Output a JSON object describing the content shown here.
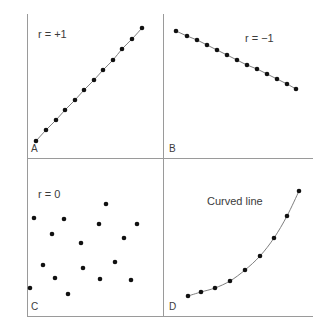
{
  "figure": {
    "background_color": "#ffffff",
    "axis_color": "#9a9a9a",
    "point_color": "#111111",
    "line_color": "#6f6f6f",
    "text_color": "#3b3b3b",
    "width": 319,
    "height": 330
  },
  "panels": {
    "a": {
      "letter": "A",
      "note": "r = +1",
      "note_x": 38,
      "note_y": 38,
      "letter_x": 31,
      "letter_y": 152
    },
    "b": {
      "letter": "B",
      "note": "r = −1",
      "note_x": 245,
      "note_y": 42,
      "letter_x": 169,
      "letter_y": 152
    },
    "c": {
      "letter": "C",
      "note": "r = 0",
      "note_x": 38,
      "note_y": 198,
      "letter_x": 31,
      "letter_y": 310
    },
    "d": {
      "letter": "D",
      "note": "Curved line",
      "note_x": 207,
      "note_y": 205,
      "letter_x": 169,
      "letter_y": 310
    }
  },
  "chart_data": [
    {
      "id": "panel-a",
      "type": "scatter",
      "title": "A",
      "annotation": "r = +1",
      "xlabel": "",
      "ylabel": "",
      "grid": false,
      "legend": false,
      "description": "Perfect positive linear relationship; all points lie exactly on an upward straight line.",
      "correlation": 1,
      "connected": true,
      "points": [
        [
          36,
          141
        ],
        [
          46,
          130
        ],
        [
          56,
          120
        ],
        [
          65,
          110
        ],
        [
          75,
          100
        ],
        [
          84,
          90
        ],
        [
          94,
          80
        ],
        [
          103,
          70
        ],
        [
          113,
          60
        ],
        [
          122,
          49
        ],
        [
          132,
          39
        ],
        [
          142,
          28
        ]
      ]
    },
    {
      "id": "panel-b",
      "type": "scatter",
      "title": "B",
      "annotation": "r = −1",
      "xlabel": "",
      "ylabel": "",
      "grid": false,
      "legend": false,
      "description": "Perfect negative linear relationship; all points lie exactly on a downward straight line.",
      "correlation": -1,
      "connected": true,
      "points": [
        [
          176,
          31
        ],
        [
          187,
          36
        ],
        [
          197,
          40
        ],
        [
          207,
          45
        ],
        [
          217,
          50
        ],
        [
          227,
          55
        ],
        [
          237,
          60
        ],
        [
          247,
          65
        ],
        [
          257,
          69
        ],
        [
          267,
          74
        ],
        [
          277,
          79
        ],
        [
          287,
          84
        ],
        [
          296,
          89
        ]
      ]
    },
    {
      "id": "panel-c",
      "type": "scatter",
      "title": "C",
      "annotation": "r = 0",
      "xlabel": "",
      "ylabel": "",
      "grid": false,
      "legend": false,
      "description": "No relationship; points are randomly scattered with no trend.",
      "correlation": 0,
      "connected": false,
      "points": [
        [
          106,
          204
        ],
        [
          34,
          218
        ],
        [
          64,
          219
        ],
        [
          137,
          224
        ],
        [
          99,
          224
        ],
        [
          52,
          234
        ],
        [
          124,
          238
        ],
        [
          81,
          243
        ],
        [
          43,
          265
        ],
        [
          115,
          262
        ],
        [
          83,
          268
        ],
        [
          55,
          278
        ],
        [
          100,
          279
        ],
        [
          131,
          280
        ],
        [
          30,
          288
        ],
        [
          68,
          294
        ]
      ]
    },
    {
      "id": "panel-d",
      "type": "scatter",
      "title": "D",
      "annotation": "Curved line",
      "xlabel": "",
      "ylabel": "",
      "grid": false,
      "legend": false,
      "description": "Curvilinear relationship; points follow a rising exponential-like curve.",
      "connected": true,
      "points": [
        [
          188,
          296
        ],
        [
          201,
          292
        ],
        [
          215,
          288
        ],
        [
          230,
          281
        ],
        [
          245,
          270
        ],
        [
          260,
          256
        ],
        [
          274,
          238
        ],
        [
          287,
          216
        ],
        [
          299,
          191
        ]
      ]
    }
  ],
  "axes": {
    "left_vertical": {
      "x": 27,
      "y1": 14,
      "y2": 316
    },
    "middle_vertical": {
      "x": 163,
      "y1": 14,
      "y2": 316
    },
    "middle_horizontal": {
      "x1": 27,
      "x2": 313,
      "y": 158
    },
    "bottom_horizontal": {
      "x1": 27,
      "x2": 313,
      "y": 316
    }
  }
}
